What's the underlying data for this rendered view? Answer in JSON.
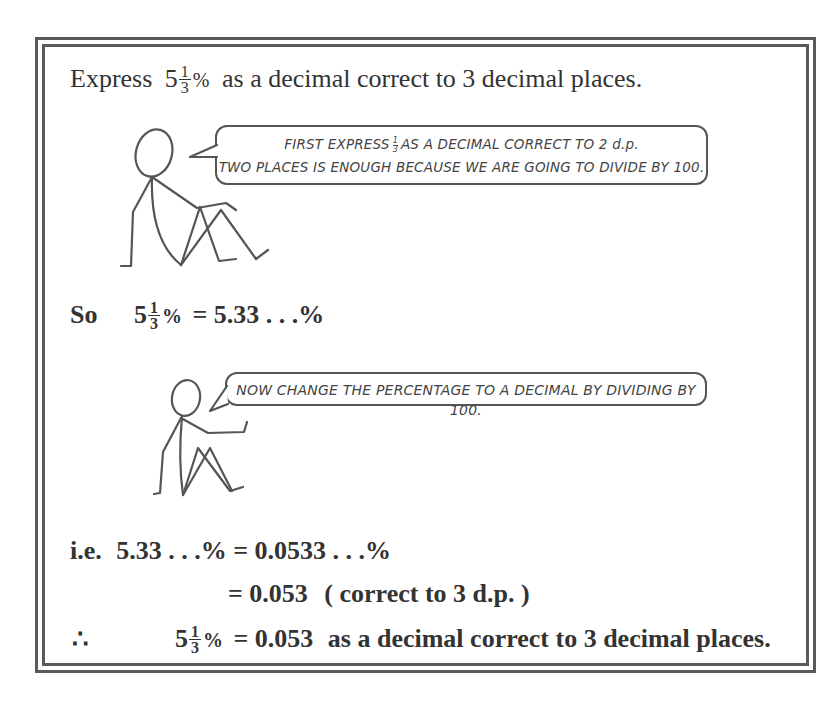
{
  "problem": {
    "prefix": "Express",
    "whole": "5",
    "frac_num": "1",
    "frac_den": "3",
    "pct": "%",
    "suffix": "as a decimal correct to 3 decimal places."
  },
  "bubble1": {
    "line1_before": "FIRST EXPRESS",
    "frac_num": "1",
    "frac_den": "3",
    "line1_after": "AS A DECIMAL CORRECT TO 2 d.p.",
    "line2": "TWO PLACES IS ENOUGH BECAUSE WE ARE GOING TO DIVIDE BY 100."
  },
  "step1": {
    "label": "So",
    "whole": "5",
    "frac_num": "1",
    "frac_den": "3",
    "pct": "%",
    "rhs": "= 5.33 . . .%"
  },
  "bubble2": {
    "text": "NOW CHANGE THE PERCENTAGE TO A DECIMAL BY DIVIDING BY 100."
  },
  "step2": {
    "label": "i.e.",
    "lhs": "5.33 . . .%",
    "rhs": "= 0.0533 . . .%"
  },
  "step3": {
    "rhs": "= 0.053",
    "note": "( correct to 3 d.p. )"
  },
  "conclusion": {
    "symbol": "∴",
    "whole": "5",
    "frac_num": "1",
    "frac_den": "3",
    "pct": "%",
    "rhs": "= 0.053",
    "suffix": "as a decimal correct to 3 decimal places."
  },
  "colors": {
    "border": "#5a5a5a",
    "text": "#333333",
    "figure_stroke": "#555555"
  }
}
